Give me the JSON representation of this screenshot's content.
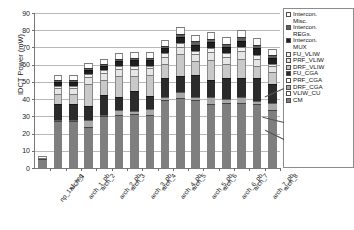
{
  "chart_data": {
    "type": "bar",
    "stacked": true,
    "title": "",
    "xlabel": "",
    "ylabel": "IDCT Power (mW)",
    "ylim": [
      0,
      90
    ],
    "ytick_step": 10,
    "yticks": [
      "0",
      "10",
      "20",
      "30",
      "40",
      "50",
      "60",
      "70",
      "80",
      "90"
    ],
    "grid": true,
    "legend_position": "right",
    "categories": [
      "np_1x1_reg",
      "arch_1",
      "arch_1_pb",
      "arch_2",
      "arch_2_pb",
      "arch_3",
      "arch_3_pb",
      "arch_4",
      "arch_4_pb",
      "arch_5",
      "arch_5_pb",
      "arch_6",
      "arch_6_pb",
      "arch_7",
      "arch_7_pb",
      "arch_8"
    ],
    "series": [
      {
        "name": "CM",
        "color": "#7f7f7f",
        "values": [
          5.0,
          27.5,
          27.5,
          24.0,
          30.0,
          30.5,
          31.5,
          31.0,
          39.5,
          40.5,
          39.5,
          37.0,
          38.0,
          37.5,
          37.0,
          33.5
        ]
      },
      {
        "name": "VLIW_CU",
        "color": "#ffffff",
        "values": [
          0.0,
          0.0,
          0.0,
          0.0,
          0.0,
          0.0,
          0.0,
          0.0,
          0.0,
          0.0,
          0.0,
          0.0,
          0.0,
          0.0,
          0.0,
          0.0
        ]
      },
      {
        "name": "DRF_CGA",
        "color": "#a8a8a8",
        "values": [
          0.0,
          0.5,
          0.5,
          4.0,
          1.0,
          3.0,
          1.5,
          3.0,
          1.5,
          3.5,
          2.0,
          4.0,
          2.0,
          4.0,
          2.0,
          4.5
        ]
      },
      {
        "name": "PRF_CGA",
        "color": "#ffffff",
        "values": [
          0.0,
          0.0,
          0.0,
          0.0,
          0.0,
          0.0,
          0.0,
          0.0,
          0.0,
          0.0,
          0.0,
          0.0,
          0.0,
          0.0,
          0.0,
          0.0
        ]
      },
      {
        "name": "FU_CGA",
        "color": "#2b2b2b",
        "values": [
          0.0,
          9.0,
          9.0,
          8.0,
          11.5,
          7.5,
          12.0,
          8.0,
          11.5,
          9.5,
          12.5,
          10.0,
          12.5,
          10.5,
          13.0,
          11.0
        ]
      },
      {
        "name": "DRF_VLIW",
        "color": "#c9c9c9",
        "values": [
          1.0,
          6.0,
          6.0,
          13.0,
          8.5,
          12.5,
          8.5,
          12.0,
          8.0,
          12.5,
          8.0,
          12.0,
          8.0,
          11.5,
          7.5,
          7.0
        ]
      },
      {
        "name": "PRF_VLIW",
        "color": "#e6e6e6",
        "values": [
          0.0,
          3.5,
          3.5,
          4.0,
          4.0,
          4.0,
          4.0,
          4.0,
          4.0,
          4.5,
          4.0,
          4.5,
          4.0,
          4.5,
          4.0,
          3.0
        ]
      },
      {
        "name": "FU_VLIW",
        "color": "#f2f2f2",
        "values": [
          0.0,
          1.0,
          1.0,
          1.5,
          2.0,
          1.5,
          2.0,
          1.5,
          2.0,
          2.0,
          2.0,
          2.0,
          2.0,
          2.0,
          2.0,
          1.5
        ]
      },
      {
        "name": "Intercon. MUX",
        "color": "#1f1f1f",
        "values": [
          0.0,
          2.5,
          2.5,
          2.5,
          2.5,
          3.0,
          3.0,
          3.0,
          3.0,
          3.5,
          3.5,
          3.5,
          3.5,
          4.0,
          4.0,
          3.5
        ]
      },
      {
        "name": "Intercon. REGs.",
        "color": "#606060",
        "values": [
          0.0,
          1.0,
          1.0,
          1.0,
          1.0,
          1.5,
          1.5,
          1.5,
          1.5,
          2.0,
          2.0,
          2.0,
          2.0,
          2.0,
          2.0,
          1.5
        ]
      },
      {
        "name": "Intercon. Misc.",
        "color": "#fcfcfc",
        "values": [
          1.0,
          3.0,
          3.0,
          3.0,
          3.0,
          3.0,
          3.5,
          3.5,
          3.5,
          4.0,
          4.0,
          4.0,
          4.0,
          4.0,
          4.0,
          3.5
        ]
      }
    ],
    "totals": [
      7.0,
      54.0,
      54.0,
      61.0,
      63.5,
      66.5,
      67.5,
      67.5,
      74.5,
      82.0,
      77.5,
      79.0,
      76.0,
      80.0,
      75.5,
      69.0
    ]
  },
  "legend": {
    "items": [
      {
        "label": "Intercon.\nMisc.",
        "color": "#fcfcfc"
      },
      {
        "label": "Intercon.\nREGs.",
        "color": "#606060"
      },
      {
        "label": "Intercon.\nMUX",
        "color": "#1f1f1f"
      },
      {
        "label": "FU_VLIW",
        "color": "#f2f2f2"
      },
      {
        "label": "PRF_VLIW",
        "color": "#e6e6e6"
      },
      {
        "label": "DRF_VLIW",
        "color": "#c9c9c9"
      },
      {
        "label": "FU_CGA",
        "color": "#2b2b2b"
      },
      {
        "label": "PRF_CGA",
        "color": "#ffffff"
      },
      {
        "label": "DRF_CGA",
        "color": "#a8a8a8"
      },
      {
        "label": "VLIW_CU",
        "color": "#ffffff"
      },
      {
        "label": "CM",
        "color": "#7f7f7f"
      }
    ]
  },
  "axis": {
    "y_title": "IDCT Power (mW)"
  }
}
